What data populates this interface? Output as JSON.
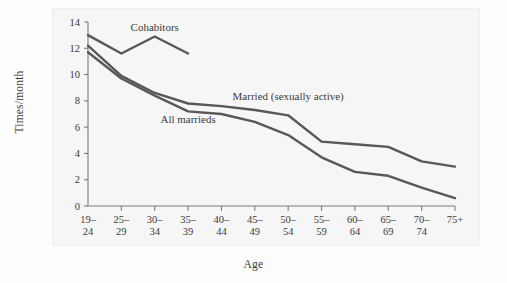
{
  "figure": {
    "background_color": "#f6f6f6",
    "page_color": "#fdfdfd",
    "line_color": "#585858",
    "axis_color": "#7c7c7c",
    "text_color": "#3b3b3b"
  },
  "chart_data": {
    "type": "line",
    "title": "",
    "xlabel": "Age",
    "ylabel": "Times/month",
    "categories": [
      "19–24",
      "25–29",
      "30–34",
      "35–39",
      "40–44",
      "45–49",
      "50–54",
      "55–59",
      "60–64",
      "65–69",
      "70–74",
      "75+"
    ],
    "xtick_labels_line1": [
      "19–",
      "25–",
      "30–",
      "35–",
      "40–",
      "45–",
      "50–",
      "55–",
      "60–",
      "65–",
      "70–",
      "75+"
    ],
    "xtick_labels_line2": [
      "24",
      "29",
      "34",
      "39",
      "44",
      "49",
      "54",
      "59",
      "64",
      "69",
      "74",
      ""
    ],
    "ytick_labels": [
      "0",
      "2",
      "4",
      "6",
      "8",
      "10",
      "12",
      "14"
    ],
    "ytick_values": [
      0,
      2,
      4,
      6,
      8,
      10,
      12,
      14
    ],
    "ylim": [
      0,
      14
    ],
    "grid": false,
    "legend_position": "inline-annotations",
    "series": [
      {
        "name": "Cohabitors",
        "label": "Cohabitors",
        "x": [
          "19–24",
          "25–29",
          "30–34",
          "35–39"
        ],
        "values": [
          13.0,
          11.6,
          12.9,
          11.6
        ],
        "label_x_category": "30–34",
        "label_y_value": 13.3
      },
      {
        "name": "Married (sexually active)",
        "label": "Married (sexually active)",
        "x": [
          "19–24",
          "25–29",
          "30–34",
          "35–39",
          "40–44",
          "45–49",
          "50–54",
          "55–59",
          "60–64",
          "65–69",
          "70–74",
          "75+"
        ],
        "values": [
          12.2,
          9.9,
          8.6,
          7.8,
          7.6,
          7.3,
          6.9,
          4.9,
          4.7,
          4.5,
          3.4,
          3.0
        ],
        "label_x_category": "50–54",
        "label_y_value": 8.1
      },
      {
        "name": "All marrieds",
        "label": "All marrieds",
        "x": [
          "19–24",
          "25–29",
          "30–34",
          "35–39",
          "40–44",
          "45–49",
          "50–54",
          "55–59",
          "60–64",
          "65–69",
          "70–74",
          "75+"
        ],
        "values": [
          11.7,
          9.7,
          8.4,
          7.2,
          7.0,
          6.4,
          5.4,
          3.7,
          2.6,
          2.3,
          1.4,
          0.6
        ],
        "label_x_category": "35–39",
        "label_y_value": 6.3
      }
    ]
  }
}
